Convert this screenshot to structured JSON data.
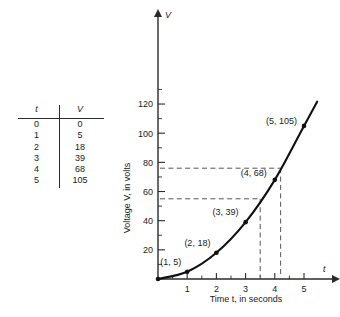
{
  "table": {
    "headers": [
      "t",
      "V"
    ],
    "rows": [
      {
        "t": "0",
        "v": "0"
      },
      {
        "t": "1",
        "v": "5"
      },
      {
        "t": "2",
        "v": "18"
      },
      {
        "t": "3",
        "v": "39"
      },
      {
        "t": "4",
        "v": "68"
      },
      {
        "t": "5",
        "v": "105"
      }
    ]
  },
  "chart_data": {
    "type": "line",
    "title": "",
    "xlabel": "Time t, in seconds",
    "ylabel": "Voltage V, in volts",
    "x_axis_name": "t",
    "y_axis_name": "V",
    "x": [
      0,
      1,
      2,
      3,
      4,
      5
    ],
    "values": [
      0,
      5,
      18,
      39,
      68,
      105
    ],
    "xlim": [
      0,
      5.6
    ],
    "ylim": [
      0,
      135
    ],
    "x_ticks": [
      "1",
      "2",
      "3",
      "4",
      "5"
    ],
    "x_tick_values": [
      1,
      2,
      3,
      4,
      5
    ],
    "x_minor_step": 0.5,
    "y_ticks": [
      "20",
      "40",
      "60",
      "80",
      "100",
      "120"
    ],
    "y_tick_values": [
      20,
      40,
      60,
      80,
      100,
      120
    ],
    "y_minor_step": 10,
    "grid": false,
    "legend": "none",
    "point_labels": [
      {
        "text": "(1, 5)",
        "x": 1,
        "y": 5
      },
      {
        "text": "(2, 18)",
        "x": 2,
        "y": 18
      },
      {
        "text": "(3, 39)",
        "x": 3,
        "y": 39
      },
      {
        "text": "(4, 68)",
        "x": 4,
        "y": 68
      },
      {
        "text": "(5, 105)",
        "x": 5,
        "y": 105
      }
    ],
    "guide_lines": [
      {
        "kind": "horizontal",
        "value": 55,
        "to_x": 3.5
      },
      {
        "kind": "horizontal",
        "value": 76,
        "to_x": 4.2
      },
      {
        "kind": "vertical",
        "value": 3.5,
        "to_y": 55
      },
      {
        "kind": "vertical",
        "value": 4.2,
        "to_y": 76
      }
    ]
  }
}
